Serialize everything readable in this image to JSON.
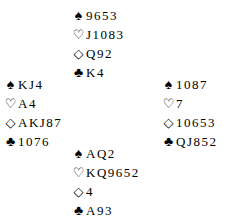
{
  "diagram": {
    "type": "bridge-deal",
    "suit_symbols": {
      "spades": "♠",
      "hearts": "♡",
      "diamonds": "◇",
      "clubs": "♣"
    },
    "hands": {
      "north": {
        "spades": "9653",
        "hearts": "J1083",
        "diamonds": "Q92",
        "clubs": "K4"
      },
      "west": {
        "spades": "KJ4",
        "hearts": "A4",
        "diamonds": "AKJ87",
        "clubs": "1076"
      },
      "east": {
        "spades": "1087",
        "hearts": "7",
        "diamonds": "10653",
        "clubs": "QJ852"
      },
      "south": {
        "spades": "AQ2",
        "hearts": "KQ9652",
        "diamonds": "4",
        "clubs": "A93"
      }
    }
  }
}
